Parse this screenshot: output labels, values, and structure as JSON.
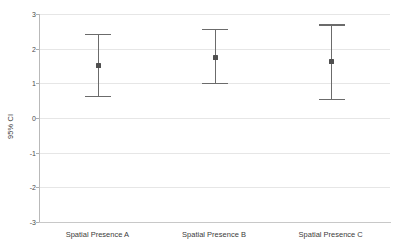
{
  "chart_data": {
    "type": "scatter",
    "title": "",
    "subtitle": "",
    "xlabel": "",
    "ylabel": "95% CI",
    "categories": [
      "Spatial Presence A",
      "Spatial Presence B",
      "Spatial Presence C"
    ],
    "ylim": [
      -3,
      3
    ],
    "yticks": [
      3,
      2,
      1,
      0,
      -1,
      -2,
      -3
    ],
    "ytick_labels": [
      "3",
      "2",
      "1",
      "0",
      "-1",
      "-2",
      "-3"
    ],
    "grid": true,
    "legend": "none",
    "series": [
      {
        "name": "95% CI",
        "points": [
          {
            "category": "Spatial Presence A",
            "mean": 1.52,
            "lower": 0.64,
            "upper": 2.43
          },
          {
            "category": "Spatial Presence B",
            "mean": 1.74,
            "lower": 1.01,
            "upper": 2.57
          },
          {
            "category": "Spatial Presence C",
            "mean": 1.63,
            "lower": 0.56,
            "upper": 2.7
          }
        ]
      }
    ],
    "colors": {
      "marker": "#4f4f4f",
      "whisker": "#6b6b6b",
      "gridline": "#e6e6e6",
      "axis": "#b9b9b9",
      "text": "#3c3c3c",
      "background": "#ffffff"
    }
  },
  "axis": {
    "y_title": "95% CI"
  }
}
